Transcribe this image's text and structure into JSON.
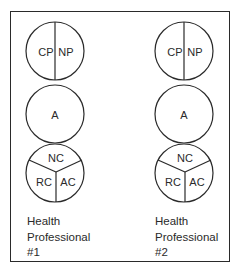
{
  "diagram": {
    "stroke_color": "#2a2a2a",
    "background": "#ffffff",
    "columns": [
      {
        "id": "hp1",
        "top_circle": {
          "left_label": "CP",
          "right_label": "NP"
        },
        "middle_circle": {
          "label": "A"
        },
        "bottom_circle": {
          "top_label": "NC",
          "left_label": "RC",
          "right_label": "AC"
        },
        "caption": {
          "line1": "Health",
          "line2": "Professional",
          "line3": "#1"
        }
      },
      {
        "id": "hp2",
        "top_circle": {
          "left_label": "CP",
          "right_label": "NP"
        },
        "middle_circle": {
          "label": "A"
        },
        "bottom_circle": {
          "top_label": "NC",
          "left_label": "RC",
          "right_label": "AC"
        },
        "caption": {
          "line1": "Health",
          "line2": "Professional",
          "line3": "#2"
        }
      }
    ]
  }
}
